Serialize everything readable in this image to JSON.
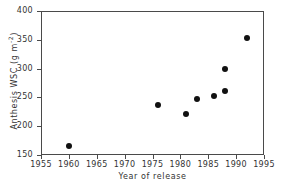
{
  "chart_data": {
    "type": "scatter",
    "title": "",
    "xlabel": "Year of release",
    "ylabel_text": "Anthesis WSC (g m",
    "ylabel_sup": "-2",
    "ylabel_tail": ")",
    "ylabel_full": "Anthesis WSC (g m-2)",
    "xlim": [
      1955,
      1995
    ],
    "ylim": [
      150,
      400
    ],
    "xticks": [
      1955,
      1960,
      1965,
      1970,
      1975,
      1980,
      1985,
      1990,
      1995
    ],
    "yticks": [
      150,
      200,
      250,
      300,
      350,
      400
    ],
    "xtick_labels": [
      "1955",
      "1960",
      "1965",
      "1970",
      "1975",
      "1980",
      "1985",
      "1990",
      "1995"
    ],
    "ytick_labels": [
      "150",
      "200",
      "250",
      "300",
      "350",
      "400"
    ],
    "grid": false,
    "legend": null,
    "marker": "filled-circle",
    "marker_color": "#111111",
    "frame_color": "#4a4a4a",
    "background": "#ffffff",
    "points": [
      {
        "x": 1960,
        "y": 165
      },
      {
        "x": 1976,
        "y": 237
      },
      {
        "x": 1981,
        "y": 221
      },
      {
        "x": 1983,
        "y": 247
      },
      {
        "x": 1986,
        "y": 252
      },
      {
        "x": 1988,
        "y": 261
      },
      {
        "x": 1988,
        "y": 300
      },
      {
        "x": 1992,
        "y": 353
      }
    ]
  }
}
